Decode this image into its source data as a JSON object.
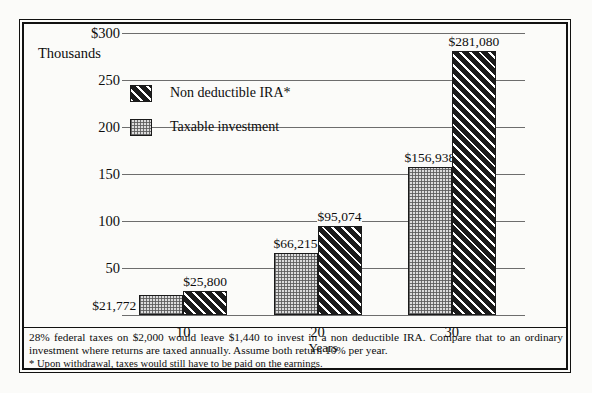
{
  "chart_data": {
    "type": "bar",
    "title": "",
    "ylabel": "Thousands",
    "xlabel": "Years",
    "categories": [
      "10",
      "20",
      "30"
    ],
    "ylim": [
      0,
      300
    ],
    "yticks": [
      300,
      250,
      200,
      150,
      100,
      50
    ],
    "ytick_labels": [
      "$300",
      "250",
      "200",
      "150",
      "100",
      "50"
    ],
    "grid": true,
    "legend_position": "upper-left-inside",
    "series": [
      {
        "name": "Taxable investment",
        "pattern": "dotted-gray",
        "values": [
          21772,
          66215,
          156938
        ],
        "value_labels": [
          "$21,772",
          "$66,215",
          "$156,938"
        ]
      },
      {
        "name": "Non deductible IRA*",
        "pattern": "diagonal-hatch-dark",
        "values": [
          25800,
          95074,
          281080
        ],
        "value_labels": [
          "$25,800",
          "$95,074",
          "$281,080"
        ]
      }
    ]
  },
  "legend": {
    "items": [
      {
        "label": "Non deductible IRA*",
        "pattern": "ira"
      },
      {
        "label": "Taxable investment",
        "pattern": "taxable"
      }
    ]
  },
  "footnote": {
    "body": "28% federal taxes on $2,000 would leave $1,440 to invest in a non deductible IRA. Compare that to an ordinary investment where returns are taxed annually. Assume both return 10% per year.",
    "star_note": "* Upon withdrawal, taxes would still have to be paid on the earnings."
  },
  "colors": {
    "ink": "#0d0d0d",
    "grid": "#6d6d6d",
    "ira_fill": "#1b1b1b",
    "taxable_fill": "#dcdcdc",
    "page": "#fbfbf9"
  }
}
